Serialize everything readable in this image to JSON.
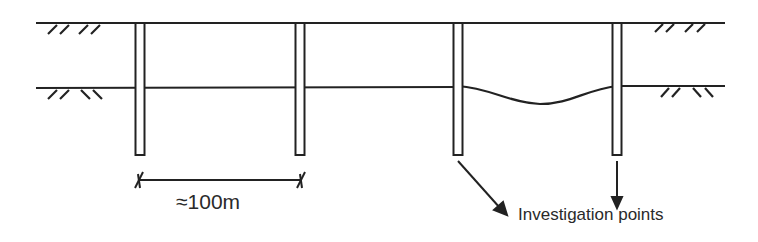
{
  "diagram": {
    "type": "site-investigation-cross-section",
    "spacing_label": "≈100m",
    "callout_label": "Investigation points",
    "pile_count": 4,
    "colors": {
      "line": "#222222",
      "text": "#2a2a2a",
      "background": "#ffffff"
    }
  }
}
